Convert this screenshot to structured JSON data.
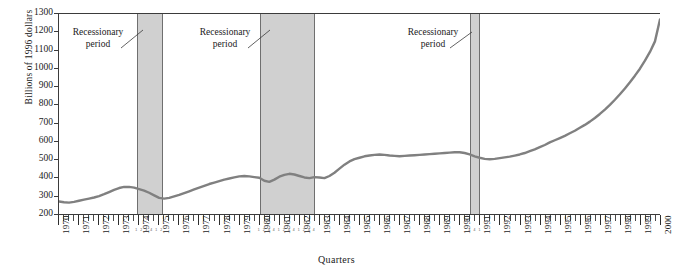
{
  "chart_data": {
    "type": "line",
    "title": "",
    "xlabel": "Quarters",
    "ylabel": "Billions of 1996 dollars",
    "ylim": [
      200,
      1300
    ],
    "ytick_step": 100,
    "yticks": [
      200,
      300,
      400,
      500,
      600,
      700,
      800,
      900,
      1000,
      1100,
      1200,
      1300
    ],
    "xlim": [
      1970,
      2000
    ],
    "xticks": [
      1970,
      1971,
      1972,
      1973,
      1974,
      1975,
      1976,
      1977,
      1978,
      1979,
      1980,
      1981,
      1982,
      1983,
      1984,
      1985,
      1986,
      1987,
      1988,
      1989,
      1990,
      1991,
      1992,
      1993,
      1994,
      1995,
      1996,
      1997,
      1998,
      1999,
      2000
    ],
    "grid": false,
    "legend": "none",
    "line_color": "#808080",
    "band_color": "#d0d0d0",
    "band_border_color": "#6f6f6f",
    "axis_color": "#3b3b3b",
    "series": [
      {
        "name": "Real investment",
        "x": [
          1970.0,
          1970.25,
          1970.5,
          1970.75,
          1971.0,
          1971.25,
          1971.5,
          1971.75,
          1972.0,
          1972.25,
          1972.5,
          1972.75,
          1973.0,
          1973.25,
          1973.5,
          1973.75,
          1974.0,
          1974.25,
          1974.5,
          1974.75,
          1975.0,
          1975.25,
          1975.5,
          1975.75,
          1976.0,
          1976.25,
          1976.5,
          1976.75,
          1977.0,
          1977.25,
          1977.5,
          1977.75,
          1978.0,
          1978.25,
          1978.5,
          1978.75,
          1979.0,
          1979.25,
          1979.5,
          1979.75,
          1980.0,
          1980.25,
          1980.5,
          1980.75,
          1981.0,
          1981.25,
          1981.5,
          1981.75,
          1982.0,
          1982.25,
          1982.5,
          1982.75,
          1983.0,
          1983.25,
          1983.5,
          1983.75,
          1984.0,
          1984.25,
          1984.5,
          1984.75,
          1985.0,
          1985.25,
          1985.5,
          1985.75,
          1986.0,
          1986.25,
          1986.5,
          1986.75,
          1987.0,
          1987.25,
          1987.5,
          1987.75,
          1988.0,
          1988.25,
          1988.5,
          1988.75,
          1989.0,
          1989.25,
          1989.5,
          1989.75,
          1990.0,
          1990.25,
          1990.5,
          1990.75,
          1991.0,
          1991.25,
          1991.5,
          1991.75,
          1992.0,
          1992.25,
          1992.5,
          1992.75,
          1993.0,
          1993.25,
          1993.5,
          1993.75,
          1994.0,
          1994.25,
          1994.5,
          1994.75,
          1995.0,
          1995.25,
          1995.5,
          1995.75,
          1996.0,
          1996.25,
          1996.5,
          1996.75,
          1997.0,
          1997.25,
          1997.5,
          1997.75,
          1998.0,
          1998.25,
          1998.5,
          1998.75,
          1999.0,
          1999.25,
          1999.5,
          1999.75,
          2000.0
        ],
        "y": [
          272,
          268,
          266,
          270,
          276,
          282,
          288,
          294,
          302,
          312,
          324,
          336,
          346,
          352,
          352,
          348,
          340,
          332,
          320,
          306,
          292,
          288,
          292,
          300,
          308,
          318,
          328,
          338,
          348,
          358,
          368,
          376,
          384,
          392,
          398,
          404,
          410,
          412,
          410,
          406,
          402,
          386,
          380,
          392,
          408,
          418,
          424,
          420,
          412,
          404,
          400,
          406,
          404,
          400,
          412,
          430,
          452,
          474,
          492,
          504,
          512,
          520,
          524,
          528,
          530,
          528,
          524,
          522,
          520,
          522,
          524,
          526,
          528,
          530,
          532,
          534,
          536,
          538,
          540,
          542,
          542,
          538,
          530,
          520,
          512,
          506,
          504,
          506,
          510,
          514,
          518,
          524,
          530,
          538,
          548,
          558,
          570,
          582,
          596,
          608,
          620,
          632,
          646,
          660,
          676,
          692,
          710,
          730,
          752,
          776,
          802,
          830,
          860,
          892,
          926,
          962,
          1000,
          1044,
          1092,
          1150,
          1270
        ]
      }
    ],
    "bands": [
      {
        "label": "Recessionary period",
        "start": 1973.9,
        "end": 1975.2
      },
      {
        "label": "Recessionary period",
        "start": 1980.0,
        "end": 1982.75
      },
      {
        "label": "Recessionary period",
        "start": 1990.5,
        "end": 1991.0
      }
    ],
    "annotations": [
      {
        "id": "ann1",
        "line1": "Recessionary",
        "line2": "period"
      },
      {
        "id": "ann2",
        "line1": "Recessionary",
        "line2": "period"
      },
      {
        "id": "ann3",
        "line1": "Recessionary",
        "line2": "period"
      }
    ],
    "micro_quarter_labels": [
      "1",
      "2",
      "3",
      "4",
      "1",
      "2",
      "3",
      "4",
      "1",
      "2"
    ]
  }
}
